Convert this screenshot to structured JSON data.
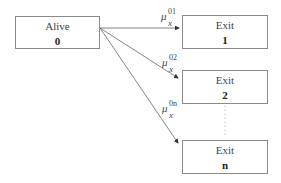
{
  "diagram": {
    "type": "multiple-decrement state diagram",
    "start_state": {
      "title": "Alive",
      "index": "0"
    },
    "exit_states": [
      {
        "title": "Exit",
        "index": "1"
      },
      {
        "title": "Exit",
        "index": "2"
      },
      {
        "title": "Exit",
        "index": "n"
      }
    ],
    "transitions": [
      {
        "from": "0",
        "to": "1",
        "symbol": "μ",
        "subscript": "x",
        "superscript": "01"
      },
      {
        "from": "0",
        "to": "2",
        "symbol": "μ",
        "subscript": "x",
        "superscript": "02"
      },
      {
        "from": "0",
        "to": "n",
        "symbol": "μ",
        "subscript": "x",
        "superscript": "0n"
      }
    ],
    "ellipsis": "⋮"
  }
}
